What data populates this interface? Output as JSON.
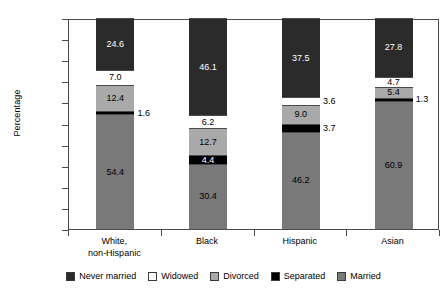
{
  "chart_data": {
    "type": "bar",
    "subtype": "stacked-bar-100",
    "title": "",
    "xlabel": "",
    "ylabel": "Percentage",
    "ylim": [
      0.0,
      100.0
    ],
    "ytick_step": 10.0,
    "ytick_labels": [
      "100.0",
      "90.0",
      "80.0",
      "70.0",
      "60.0",
      "50.0",
      "40.0",
      "30.0",
      "20.0",
      "10.0",
      "0.0"
    ],
    "grid": false,
    "legend_position": "bottom",
    "categories": [
      "White,\nnon-Hispanic",
      "Black",
      "Hispanic",
      "Asian"
    ],
    "category_labels": [
      {
        "line1": "White,",
        "line2": "non-Hispanic"
      },
      {
        "line1": "Black",
        "line2": ""
      },
      {
        "line1": "Hispanic",
        "line2": ""
      },
      {
        "line1": "Asian",
        "line2": ""
      }
    ],
    "series": [
      {
        "name": "Never married",
        "color": "#2b2b2b",
        "text_color": "#ffffff",
        "values": [
          24.6,
          46.1,
          37.5,
          27.8
        ],
        "labels": [
          "24.6",
          "46.1",
          "37.5",
          "27.8"
        ],
        "label_outside": [
          false,
          false,
          false,
          false
        ]
      },
      {
        "name": "Widowed",
        "color": "#ffffff",
        "text_color": "#000000",
        "values": [
          7.0,
          6.2,
          3.6,
          4.7
        ],
        "labels": [
          "7.0",
          "6.2",
          "3.6",
          "4.7"
        ],
        "label_outside": [
          false,
          false,
          true,
          false
        ]
      },
      {
        "name": "Divorced",
        "color": "#a9a9a9",
        "text_color": "#000000",
        "values": [
          12.4,
          12.7,
          9.0,
          5.4
        ],
        "labels": [
          "12.4",
          "12.7",
          "9.0",
          "5.4"
        ],
        "label_outside": [
          false,
          false,
          false,
          false
        ]
      },
      {
        "name": "Separated",
        "color": "#000000",
        "text_color": "#ffffff",
        "values": [
          1.6,
          4.4,
          3.7,
          1.3
        ],
        "labels": [
          "1.6",
          "4.4",
          "3.7",
          "1.3"
        ],
        "label_outside": [
          true,
          false,
          true,
          true
        ]
      },
      {
        "name": "Married",
        "color": "#797979",
        "text_color": "#000000",
        "values": [
          54.4,
          30.4,
          46.2,
          60.9
        ],
        "labels": [
          "54.4",
          "30.4",
          "46.2",
          "60.9"
        ],
        "label_outside": [
          false,
          false,
          false,
          false
        ]
      }
    ],
    "legend": [
      {
        "label": "Never married",
        "color": "#2b2b2b"
      },
      {
        "label": "Widowed",
        "color": "#ffffff"
      },
      {
        "label": "Divorced",
        "color": "#a9a9a9"
      },
      {
        "label": "Separated",
        "color": "#000000"
      },
      {
        "label": "Married",
        "color": "#797979"
      }
    ]
  }
}
